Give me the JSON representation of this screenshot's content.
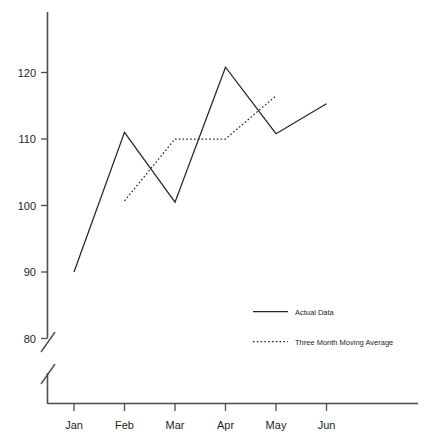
{
  "chart_data": {
    "type": "line",
    "title": "",
    "subtitle": "",
    "xlabel": "",
    "ylabel": "",
    "categories": [
      "Jan",
      "Feb",
      "Mar",
      "Apr",
      "May",
      "Jun"
    ],
    "ylim": [
      80,
      125
    ],
    "yticks": [
      80,
      90,
      100,
      110,
      120
    ],
    "ytick_labels": [
      "80",
      "90",
      "100",
      "110",
      "120"
    ],
    "grid": false,
    "axis_break": true,
    "legend_position": "inside-lower-right",
    "series": [
      {
        "name": "Actual Data",
        "style": "solid",
        "color": "#262626",
        "x": [
          "Jan",
          "Feb",
          "Mar",
          "Apr",
          "May",
          "Jun"
        ],
        "values": [
          90,
          111,
          100.5,
          120.8,
          110.8,
          115.3
        ]
      },
      {
        "name": "Three Month Moving Average",
        "style": "dotted",
        "color": "#262626",
        "x": [
          "Feb",
          "Mar",
          "Apr",
          "May"
        ],
        "values": [
          100.7,
          110,
          110,
          116.5
        ]
      }
    ]
  },
  "axes": {
    "y_ticks": [
      {
        "label": "120",
        "value": 120
      },
      {
        "label": "110",
        "value": 110
      },
      {
        "label": "100",
        "value": 100
      },
      {
        "label": "90",
        "value": 90
      },
      {
        "label": "80",
        "value": 80
      }
    ],
    "x_ticks": [
      {
        "label": "Jan"
      },
      {
        "label": "Feb"
      },
      {
        "label": "Mar"
      },
      {
        "label": "Apr"
      },
      {
        "label": "May"
      },
      {
        "label": "Jun"
      }
    ]
  },
  "legend": {
    "entries": [
      {
        "label": "Actual Data",
        "style": "solid"
      },
      {
        "label": "Three Month Moving Average",
        "style": "dotted"
      }
    ]
  },
  "colors": {
    "series": "#262626",
    "axis": "#4d4d4d",
    "background": "#ffffff",
    "text": "#231f20"
  }
}
